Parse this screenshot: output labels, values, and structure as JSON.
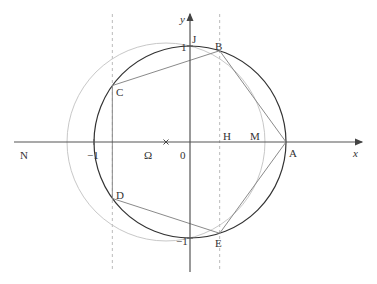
{
  "figure": {
    "axes": {
      "x_label": "x",
      "y_label": "y",
      "origin_label": "0",
      "tick_labels": {
        "x_minus_one": "−1",
        "y_one": "1",
        "y_minus_one": "−1"
      }
    },
    "points": {
      "A": {
        "label": "A",
        "x": 1,
        "y": 0
      },
      "B": {
        "label": "B",
        "x": 0.309,
        "y": 0.951
      },
      "C": {
        "label": "C",
        "x": -0.809,
        "y": 0.588
      },
      "D": {
        "label": "D",
        "x": -0.809,
        "y": -0.588
      },
      "E": {
        "label": "E",
        "x": 0.309,
        "y": -0.951
      },
      "J": {
        "label": "J",
        "x": 0,
        "y": 1
      },
      "H": {
        "label": "H",
        "x": 0.309,
        "y": 0
      },
      "M": {
        "label": "M",
        "x": 0.781,
        "y": 0
      },
      "N": {
        "label": "N",
        "x": -1.281,
        "y": 0
      },
      "Omega": {
        "label": "Ω",
        "x": -0.25,
        "y": 0
      }
    },
    "unit_circle": {
      "center": [
        0,
        0
      ],
      "radius": 1
    },
    "aux_circle": {
      "center_label": "Ω",
      "center": [
        -0.25,
        0
      ],
      "radius": 1.031
    },
    "dashed_verticals_x": [
      0.309,
      -0.809
    ],
    "colors": {
      "axis": "#555555",
      "unit_circle": "#333333",
      "aux_circle": "#c8c8c8",
      "pentagon": "#8a8a8a",
      "dashed": "#bbbbbb"
    }
  }
}
